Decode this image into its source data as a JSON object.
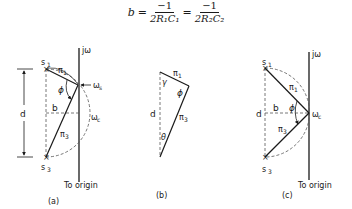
{
  "formula": {
    "lhs": "b",
    "eq": "=",
    "frac1": {
      "num": "−1",
      "den": "2R₁C₁"
    },
    "frac2": {
      "num": "−1",
      "den": "2R₂C₂"
    }
  },
  "panels": {
    "a": {
      "caption": "(a)",
      "axis_label": "jω",
      "s1": "s",
      "s1_sub": "1",
      "s3": "s",
      "s3_sub": "3",
      "pi1": "π",
      "pi1_sub": "1",
      "pi3": "π",
      "pi3_sub": "3",
      "phi": "ϕ",
      "b": "b",
      "d": "d",
      "omega_s": "ω",
      "omega_s_sub": "s",
      "omega_c": "ω",
      "omega_c_sub": "c",
      "to_origin": "To origin"
    },
    "b": {
      "caption": "(b)",
      "pi1": "π",
      "pi1_sub": "1",
      "pi3": "π",
      "pi3_sub": "3",
      "gamma": "γ",
      "phi": "ϕ",
      "theta": "θ",
      "d": "d"
    },
    "c": {
      "caption": "(c)",
      "axis_label": "jω",
      "s1": "s",
      "s1_sub": "1",
      "s3": "s",
      "s3_sub": "3",
      "pi1": "π",
      "pi1_sub": "1",
      "pi3": "π",
      "pi3_sub": "3",
      "phi": "ϕ",
      "b": "b",
      "d": "d",
      "omega_c": "ω",
      "omega_c_sub": "c",
      "to_origin": "To origin"
    }
  }
}
